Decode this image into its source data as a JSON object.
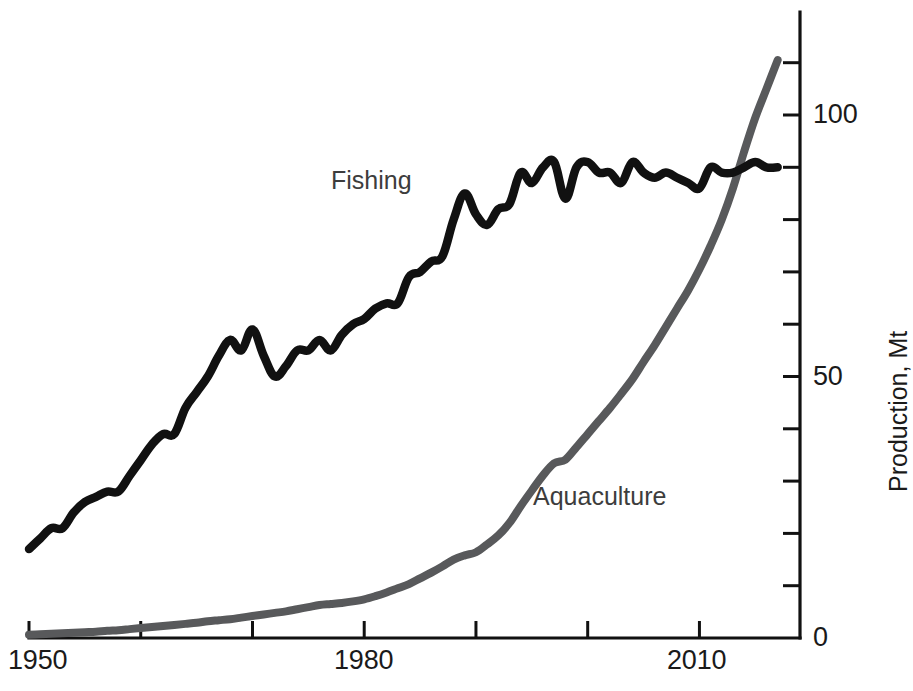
{
  "chart_data": {
    "type": "line",
    "title": "",
    "subtitle": "",
    "xlabel": "",
    "ylabel": "Production, Mt",
    "xlim": [
      1950,
      2019
    ],
    "ylim": [
      0,
      115
    ],
    "grid": false,
    "legend_position": "inline-annotation",
    "x_ticks_labeled": [
      "1950",
      "1980",
      "2010"
    ],
    "x_tick_values": [
      1950,
      1960,
      1970,
      1980,
      1990,
      2000,
      2010
    ],
    "y_ticks_labeled": [
      "0",
      "50",
      "100"
    ],
    "y_tick_values": [
      0,
      10,
      20,
      30,
      40,
      50,
      60,
      70,
      80,
      90,
      100,
      110
    ],
    "x": [
      1950,
      1951,
      1952,
      1953,
      1954,
      1955,
      1956,
      1957,
      1958,
      1959,
      1960,
      1961,
      1962,
      1963,
      1964,
      1965,
      1966,
      1967,
      1968,
      1969,
      1970,
      1971,
      1972,
      1973,
      1974,
      1975,
      1976,
      1977,
      1978,
      1979,
      1980,
      1981,
      1982,
      1983,
      1984,
      1985,
      1986,
      1987,
      1988,
      1989,
      1990,
      1991,
      1992,
      1993,
      1994,
      1995,
      1996,
      1997,
      1998,
      1999,
      2000,
      2001,
      2002,
      2003,
      2004,
      2005,
      2006,
      2007,
      2008,
      2009,
      2010,
      2011,
      2012,
      2013,
      2014,
      2015,
      2016,
      2017
    ],
    "series": [
      {
        "name": "Fishing",
        "color": "#111111",
        "label_text": "Fishing",
        "values": [
          17,
          19,
          21,
          21,
          24,
          26,
          27,
          28,
          28,
          31,
          34,
          37,
          39,
          39,
          44,
          47,
          50,
          54,
          57,
          55,
          59,
          54,
          50,
          52,
          55,
          55,
          57,
          55,
          58,
          60,
          61,
          63,
          64,
          64,
          69,
          70,
          72,
          73,
          80,
          85,
          81,
          79,
          82,
          83,
          89,
          87,
          90,
          91,
          84,
          90,
          91,
          89,
          89,
          87,
          91,
          89,
          88,
          89,
          88,
          87,
          86,
          90,
          89,
          89,
          90,
          91,
          90,
          90
        ]
      },
      {
        "name": "Aquaculture",
        "color": "#58595b",
        "label_text": "Aquaculture",
        "values": [
          0.6,
          0.7,
          0.8,
          0.9,
          1.0,
          1.1,
          1.2,
          1.4,
          1.5,
          1.7,
          1.9,
          2.1,
          2.3,
          2.5,
          2.7,
          2.9,
          3.2,
          3.4,
          3.6,
          3.9,
          4.2,
          4.5,
          4.8,
          5.1,
          5.5,
          5.9,
          6.3,
          6.5,
          6.7,
          7.0,
          7.4,
          8.0,
          8.7,
          9.5,
          10.3,
          11.4,
          12.5,
          13.7,
          15.0,
          15.8,
          16.4,
          17.9,
          19.6,
          22.0,
          25.2,
          28.2,
          31.1,
          33.4,
          34.1,
          36.5,
          39.0,
          41.5,
          44.0,
          46.7,
          49.5,
          52.8,
          56.0,
          59.5,
          63.0,
          66.5,
          70.5,
          75.0,
          80.0,
          86.0,
          93.0,
          99.5,
          105.0,
          110.5
        ]
      }
    ],
    "annotations": [
      {
        "text": "Fishing",
        "x_year": 1977,
        "y_value": 92
      },
      {
        "text": "Aquaculture",
        "x_year": 1996,
        "y_value": 30
      }
    ]
  },
  "axes": {
    "y_axis": {
      "title": "Production, Mt",
      "labels": {
        "zero": "0",
        "fifty": "50",
        "hundred": "100"
      }
    },
    "x_axis": {
      "labels": {
        "start": "1950",
        "middle": "1980",
        "end": "2010"
      }
    }
  },
  "colors": {
    "fishing": "#111111",
    "aquaculture": "#58595b",
    "axis": "#111111",
    "label_text": "#3d3d3d",
    "background": "#ffffff"
  }
}
